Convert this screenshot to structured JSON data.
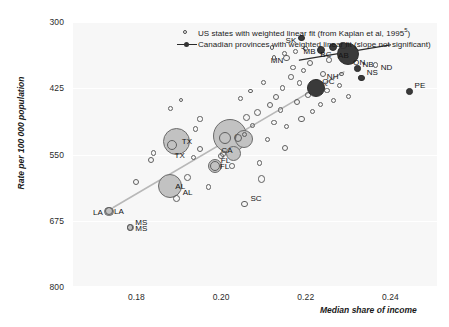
{
  "chart_data": {
    "type": "scatter",
    "title": "",
    "xlabel": "Median share of income",
    "ylabel": "Rate per 100 000 population",
    "xlim": [
      0.165,
      0.251
    ],
    "ylim": [
      300,
      800
    ],
    "xticks": [
      "0.18",
      "0.20",
      "0.22",
      "0.24"
    ],
    "xtick_values": [
      0.18,
      0.2,
      0.22,
      0.24
    ],
    "yticks": [
      "800",
      "675",
      "550",
      "425",
      "300"
    ],
    "ytick_values": [
      800,
      675,
      550,
      425,
      300
    ],
    "grid": "horizontal gridlines at y ticks, white on light grey panel",
    "legend_position": "top-center-right inside plot",
    "legend": [
      {
        "marker": "open-circle",
        "label": "US states with weighted linear fit (from Kaplan et al, 1995",
        "sup": "5",
        "label_tail": ")"
      },
      {
        "marker": "filled-dot-with-line",
        "label": "Canadian provinces with weighted linear fit (slope not significant)"
      }
    ],
    "series": [
      {
        "name": "US states",
        "marker": "open-circle",
        "color": "#5f5f5f",
        "points": [
          {
            "label": "MS",
            "x": 0.1785,
            "y": 688,
            "size": 3.2,
            "label_dx": 5,
            "label_dy": -10
          },
          {
            "label": "LA",
            "x": 0.1735,
            "y": 657,
            "size": 4.2,
            "label_dx": -16,
            "label_dy": -3
          },
          {
            "label": "AL",
            "x": 0.1895,
            "y": 633,
            "size": 3.4,
            "label_dx": 6,
            "label_dy": -10
          },
          {
            "label": "SC",
            "x": 0.2055,
            "y": 643,
            "size": 3.2,
            "label_dx": 6,
            "label_dy": -10
          },
          {
            "label": "FL",
            "x": 0.1985,
            "y": 572,
            "size": 5.2,
            "label_dx": 6,
            "label_dy": -10
          },
          {
            "label": "TX",
            "x": 0.1885,
            "y": 533,
            "size": 5.0,
            "label_dx": 2,
            "label_dy": 6
          },
          {
            "label": "CA",
            "x": 0.201,
            "y": 519,
            "size": 6.0,
            "label_dx": -4,
            "label_dy": 8
          },
          {
            "label": "MN",
            "x": 0.2155,
            "y": 368,
            "size": 3.4,
            "label_dx": -16,
            "label_dy": -2
          },
          {
            "label": "NH",
            "x": 0.2285,
            "y": 398,
            "size": 2.4,
            "label_dx": -15,
            "label_dy": -2
          },
          {
            "label": "NS_us_none",
            "x": 0.233,
            "y": 404,
            "size": 2.4,
            "label_dx": 0,
            "label_dy": 0,
            "hide_label": true
          },
          {
            "label": "ND",
            "x": 0.2365,
            "y": 381,
            "size": 2.6,
            "label_dx": 5,
            "label_dy": -2
          },
          {
            "label": "",
            "x": 0.18,
            "y": 601,
            "size": 3.0
          },
          {
            "label": "",
            "x": 0.1835,
            "y": 560,
            "size": 3.0
          },
          {
            "label": "",
            "x": 0.184,
            "y": 547,
            "size": 2.8
          },
          {
            "label": "",
            "x": 0.192,
            "y": 594,
            "size": 3.4
          },
          {
            "label": "",
            "x": 0.1935,
            "y": 556,
            "size": 2.6
          },
          {
            "label": "",
            "x": 0.195,
            "y": 540,
            "size": 3.0
          },
          {
            "label": "",
            "x": 0.194,
            "y": 502,
            "size": 2.6
          },
          {
            "label": "",
            "x": 0.195,
            "y": 483,
            "size": 2.6
          },
          {
            "label": "",
            "x": 0.197,
            "y": 611,
            "size": 2.8
          },
          {
            "label": "",
            "x": 0.2,
            "y": 553,
            "size": 3.0
          },
          {
            "label": "",
            "x": 0.2005,
            "y": 549,
            "size": 3.2
          },
          {
            "label": "",
            "x": 0.2025,
            "y": 572,
            "size": 2.8
          },
          {
            "label": "",
            "x": 0.204,
            "y": 519,
            "size": 4.0
          },
          {
            "label": "",
            "x": 0.2055,
            "y": 512,
            "size": 2.6
          },
          {
            "label": "",
            "x": 0.206,
            "y": 480,
            "size": 3.4
          },
          {
            "label": "",
            "x": 0.2075,
            "y": 496,
            "size": 2.6
          },
          {
            "label": "",
            "x": 0.2085,
            "y": 470,
            "size": 3.6
          },
          {
            "label": "",
            "x": 0.209,
            "y": 566,
            "size": 2.6
          },
          {
            "label": "",
            "x": 0.2095,
            "y": 596,
            "size": 3.8
          },
          {
            "label": "",
            "x": 0.211,
            "y": 522,
            "size": 2.6
          },
          {
            "label": "",
            "x": 0.2115,
            "y": 457,
            "size": 3.2
          },
          {
            "label": "",
            "x": 0.2125,
            "y": 489,
            "size": 2.6
          },
          {
            "label": "",
            "x": 0.213,
            "y": 441,
            "size": 3.0
          },
          {
            "label": "",
            "x": 0.214,
            "y": 466,
            "size": 2.6
          },
          {
            "label": "",
            "x": 0.2145,
            "y": 424,
            "size": 2.8
          },
          {
            "label": "",
            "x": 0.215,
            "y": 538,
            "size": 3.0
          },
          {
            "label": "",
            "x": 0.2155,
            "y": 497,
            "size": 2.6
          },
          {
            "label": "",
            "x": 0.2165,
            "y": 404,
            "size": 2.8
          },
          {
            "label": "",
            "x": 0.217,
            "y": 386,
            "size": 2.6
          },
          {
            "label": "",
            "x": 0.218,
            "y": 451,
            "size": 3.0
          },
          {
            "label": "",
            "x": 0.2185,
            "y": 415,
            "size": 2.6
          },
          {
            "label": "",
            "x": 0.219,
            "y": 483,
            "size": 3.4
          },
          {
            "label": "",
            "x": 0.2195,
            "y": 392,
            "size": 2.6
          },
          {
            "label": "",
            "x": 0.2205,
            "y": 438,
            "size": 2.8
          },
          {
            "label": "",
            "x": 0.221,
            "y": 377,
            "size": 3.0
          },
          {
            "label": "",
            "x": 0.2215,
            "y": 469,
            "size": 2.6
          },
          {
            "label": "",
            "x": 0.2225,
            "y": 412,
            "size": 2.8
          },
          {
            "label": "",
            "x": 0.2235,
            "y": 455,
            "size": 2.6
          },
          {
            "label": "",
            "x": 0.224,
            "y": 398,
            "size": 3.0
          },
          {
            "label": "",
            "x": 0.225,
            "y": 430,
            "size": 2.6
          },
          {
            "label": "",
            "x": 0.2255,
            "y": 372,
            "size": 2.8
          },
          {
            "label": "",
            "x": 0.2265,
            "y": 448,
            "size": 2.6
          },
          {
            "label": "",
            "x": 0.228,
            "y": 420,
            "size": 2.6
          },
          {
            "label": "",
            "x": 0.23,
            "y": 441,
            "size": 2.6
          },
          {
            "label": "",
            "x": 0.188,
            "y": 463,
            "size": 2.4
          },
          {
            "label": "",
            "x": 0.1905,
            "y": 447,
            "size": 2.4
          },
          {
            "label": "",
            "x": 0.2045,
            "y": 445,
            "size": 2.4
          },
          {
            "label": "",
            "x": 0.207,
            "y": 430,
            "size": 2.4
          },
          {
            "label": "",
            "x": 0.21,
            "y": 414,
            "size": 2.4
          },
          {
            "label": "",
            "x": 0.2125,
            "y": 367,
            "size": 2.4
          },
          {
            "label": "",
            "x": 0.215,
            "y": 360,
            "size": 2.4
          },
          {
            "label": "",
            "x": 0.2175,
            "y": 355,
            "size": 2.4
          },
          {
            "label": "",
            "x": 0.22,
            "y": 350,
            "size": 2.4
          },
          {
            "label": "",
            "x": 0.212,
            "y": 348,
            "size": 2.4
          }
        ],
        "weighted_points": [
          {
            "label": "LA",
            "x": 0.1735,
            "y": 657,
            "size": 4.6
          },
          {
            "label": "MS",
            "x": 0.1785,
            "y": 688,
            "size": 3.6
          },
          {
            "label": "AL",
            "x": 0.188,
            "y": 610,
            "size": 12.0
          },
          {
            "label": "TX",
            "x": 0.1895,
            "y": 525,
            "size": 13.5
          },
          {
            "label": "CA",
            "x": 0.202,
            "y": 515,
            "size": 17.0
          },
          {
            "label": "FL",
            "x": 0.1985,
            "y": 572,
            "size": 7.0
          },
          {
            "label": "",
            "x": 0.2055,
            "y": 520,
            "size": 9.0
          },
          {
            "label": "",
            "x": 0.203,
            "y": 548,
            "size": 7.5
          }
        ],
        "fit_line": {
          "x1": 0.1745,
          "y1": 650,
          "x2": 0.229,
          "y2": 394,
          "color": "#b8b8b8",
          "width": 1.6
        }
      },
      {
        "name": "Canadian provinces",
        "marker": "filled-circle",
        "color": "#3a3a3a",
        "points": [
          {
            "label": "QC",
            "x": 0.2225,
            "y": 424,
            "size": 9.0,
            "label_dx": 6,
            "label_dy": -11
          },
          {
            "label": "ON",
            "x": 0.23,
            "y": 360,
            "size": 11.0,
            "label_dx": 5,
            "label_dy": 4
          },
          {
            "label": "MB",
            "x": 0.2235,
            "y": 352,
            "size": 4.0,
            "label_dx": -17,
            "label_dy": -3
          },
          {
            "label": "BC",
            "x": 0.2265,
            "y": 347,
            "size": 4.0,
            "label_dx": -13,
            "label_dy": 3
          },
          {
            "label": "AB",
            "x": 0.2288,
            "y": 344,
            "size": 3.6,
            "label_dx": -5,
            "label_dy": 6
          },
          {
            "label": "SK",
            "x": 0.219,
            "y": 330,
            "size": 3.2,
            "label_dx": -16,
            "label_dy": -2
          },
          {
            "label": "NS",
            "x": 0.2332,
            "y": 406,
            "size": 3.2,
            "label_dx": 5,
            "label_dy": -10
          },
          {
            "label": "NB",
            "x": 0.2322,
            "y": 388,
            "size": 3.2,
            "label_dx": 5,
            "label_dy": -9
          },
          {
            "label": "PE",
            "x": 0.2445,
            "y": 431,
            "size": 3.4,
            "label_dx": 5,
            "label_dy": -10
          }
        ],
        "fit_line": {
          "x1": 0.2185,
          "y1": 372,
          "x2": 0.24,
          "y2": 343,
          "color": "#2a2a2a",
          "width": 1.3
        }
      }
    ]
  }
}
